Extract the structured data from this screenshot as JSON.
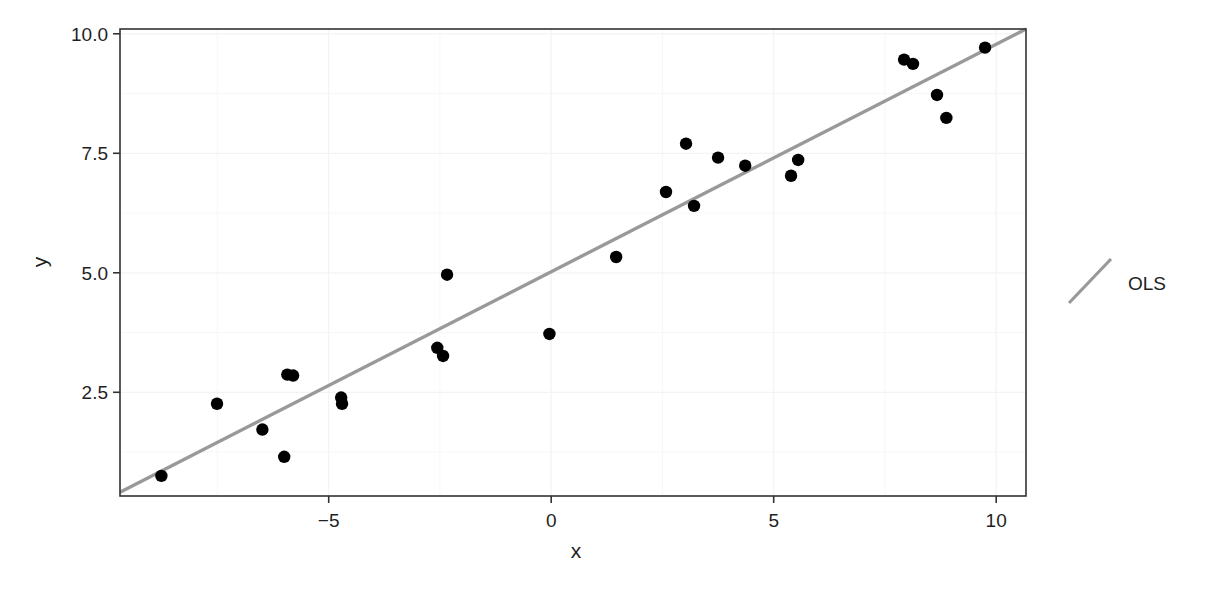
{
  "chart_data": {
    "type": "scatter",
    "title": "",
    "xlabel": "x",
    "ylabel": "y",
    "xlim": [
      -9.69,
      10.67
    ],
    "ylim": [
      0.33,
      10.1
    ],
    "grid": true,
    "x_ticks": [
      -5,
      0,
      5,
      10
    ],
    "x_tick_labels": [
      "−5",
      "0",
      "5",
      "10"
    ],
    "y_ticks": [
      2.5,
      5.0,
      7.5,
      10.0
    ],
    "y_tick_labels": [
      "2.5",
      "5.0",
      "7.5",
      "10.0"
    ],
    "legend": {
      "position": "right",
      "entries": [
        {
          "label": "OLS",
          "type": "line",
          "color": "#999999"
        }
      ]
    },
    "series": [
      {
        "name": "data",
        "type": "scatter",
        "color": "#000000",
        "points": [
          {
            "x": -8.76,
            "y": 0.75
          },
          {
            "x": -7.51,
            "y": 2.26
          },
          {
            "x": -6.49,
            "y": 1.72
          },
          {
            "x": -6.0,
            "y": 1.15
          },
          {
            "x": -5.93,
            "y": 2.87
          },
          {
            "x": -5.8,
            "y": 2.85
          },
          {
            "x": -4.72,
            "y": 2.39
          },
          {
            "x": -4.7,
            "y": 2.26
          },
          {
            "x": -2.56,
            "y": 3.43
          },
          {
            "x": -2.43,
            "y": 3.26
          },
          {
            "x": -2.34,
            "y": 4.96
          },
          {
            "x": -0.04,
            "y": 3.72
          },
          {
            "x": 1.46,
            "y": 5.33
          },
          {
            "x": 2.58,
            "y": 6.69
          },
          {
            "x": 3.03,
            "y": 7.7
          },
          {
            "x": 3.21,
            "y": 6.4
          },
          {
            "x": 3.75,
            "y": 7.41
          },
          {
            "x": 4.36,
            "y": 7.24
          },
          {
            "x": 5.39,
            "y": 7.03
          },
          {
            "x": 5.55,
            "y": 7.36
          },
          {
            "x": 7.93,
            "y": 9.46
          },
          {
            "x": 8.13,
            "y": 9.37
          },
          {
            "x": 8.67,
            "y": 8.72
          },
          {
            "x": 8.88,
            "y": 8.24
          },
          {
            "x": 9.75,
            "y": 9.71
          }
        ]
      },
      {
        "name": "OLS",
        "type": "line",
        "color": "#999999",
        "slope": 0.476,
        "intercept": 5.02,
        "x": [
          -9.69,
          10.67
        ],
        "y": [
          0.41,
          10.1
        ]
      }
    ]
  },
  "colors": {
    "points": "#000000",
    "ols_line": "#999999",
    "panel_border": "#333333",
    "grid": "#f3f3f3"
  }
}
